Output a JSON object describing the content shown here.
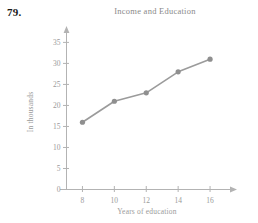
{
  "problem": {
    "number": "79."
  },
  "chart_data": {
    "type": "line",
    "title": "Income and Education",
    "xlabel": "Years of education",
    "ylabel": "In thousands",
    "x": [
      8,
      10,
      12,
      14,
      16
    ],
    "values": [
      16,
      21,
      23,
      28,
      31
    ],
    "xtick_labels": [
      "8",
      "10",
      "12",
      "14",
      "16"
    ],
    "ytick_labels": [
      "0",
      "5",
      "10",
      "15",
      "20",
      "25",
      "30",
      "35"
    ],
    "xlim": [
      7,
      17
    ],
    "ylim": [
      0,
      37
    ],
    "grid": false,
    "legend": false,
    "line_color": "#9b9b9b",
    "marker_color": "#8f8f8f",
    "axis_color": "#b3b3b3"
  }
}
